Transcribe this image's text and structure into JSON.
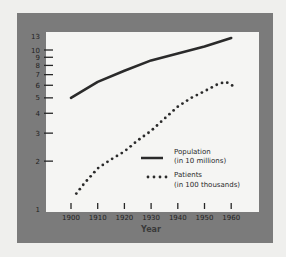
{
  "chart_data": {
    "type": "line",
    "title": "",
    "xlabel": "Year",
    "ylabel": "",
    "y_scale": "log",
    "ylim": [
      1,
      13
    ],
    "xlim": [
      1898,
      1965
    ],
    "x_ticks": [
      1900,
      1910,
      1920,
      1930,
      1940,
      1950,
      1960
    ],
    "x_tick_labels": [
      "1900",
      "1910",
      "1920",
      "1930",
      "1940",
      "1950",
      "1960"
    ],
    "y_ticks": [
      1,
      2,
      3,
      4,
      5,
      6,
      7,
      8,
      9,
      10,
      13
    ],
    "y_tick_labels": [
      "1",
      "2",
      "3",
      "4",
      "5",
      "6",
      "7",
      "8",
      "9",
      "10",
      "13"
    ],
    "y_tick_marks": [
      2,
      3,
      4,
      5,
      6,
      7,
      8,
      9,
      10
    ],
    "grid": false,
    "legend_position": "bottom-right",
    "series": [
      {
        "name": "Population",
        "name_line2": "(in 10 millions)",
        "style": "solid",
        "color": "#2a2a2a",
        "x": [
          1900,
          1910,
          1920,
          1930,
          1940,
          1950,
          1960
        ],
        "values": [
          5.0,
          6.3,
          7.4,
          8.6,
          9.5,
          10.5,
          11.9
        ]
      },
      {
        "name": "Patients",
        "name_line2": "(in 100 thousands)",
        "style": "dotted",
        "color": "#2a2a2a",
        "x": [
          1902,
          1905,
          1910,
          1915,
          1920,
          1925,
          1930,
          1935,
          1940,
          1945,
          1950,
          1955,
          1958,
          1961
        ],
        "values": [
          1.25,
          1.45,
          1.8,
          2.05,
          2.3,
          2.7,
          3.1,
          3.7,
          4.4,
          5.0,
          5.5,
          6.1,
          6.3,
          5.9
        ]
      }
    ]
  },
  "colors": {
    "frame": "#7b7b7b",
    "plot_background": "#f5f5f3",
    "ink": "#262626"
  }
}
